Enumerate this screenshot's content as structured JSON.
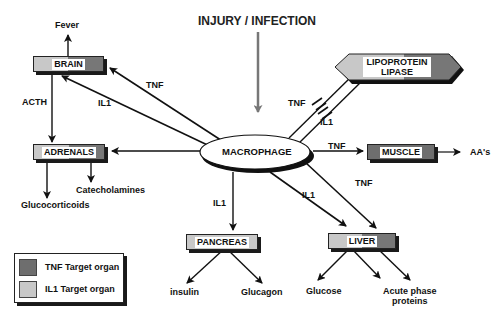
{
  "title": "INJURY / INFECTION",
  "center_node": "MACROPHAGE",
  "organs": {
    "brain": {
      "label": "BRAIN",
      "target": "both"
    },
    "adrenals": {
      "label": "ADRENALS",
      "target": "both"
    },
    "lipoprotein_lipase": {
      "label_line1": "LIPOPROTEIN",
      "label_line2": "LIPASE",
      "target": "both"
    },
    "muscle": {
      "label": "MUSCLE",
      "target": "TNF"
    },
    "pancreas": {
      "label": "PANCREAS",
      "target": "IL1"
    },
    "liver": {
      "label": "LIVER",
      "target": "both"
    }
  },
  "edge_labels": {
    "brain_tnf": "TNF",
    "brain_il1": "IL1",
    "acth": "ACTH",
    "lipase_tnf": "TNF",
    "lipase_il1": "IL1",
    "muscle_tnf": "TNF",
    "liver_tnf": "TNF",
    "liver_il1": "IL1",
    "pancreas_il1": "IL1"
  },
  "outputs": {
    "fever": "Fever",
    "catecholamines": "Catecholamines",
    "glucocorticoids": "Glucocorticoids",
    "aas": "AA's",
    "insulin": "insulin",
    "glucagon": "Glucagon",
    "glucose": "Glucose",
    "acute_phase_line1": "Acute phase",
    "acute_phase_line2": "proteins"
  },
  "legend": [
    {
      "label": "TNF Target organ",
      "color": "#6e6e6e"
    },
    {
      "label": "IL1 Target organ",
      "color": "#c8c8c8"
    }
  ]
}
